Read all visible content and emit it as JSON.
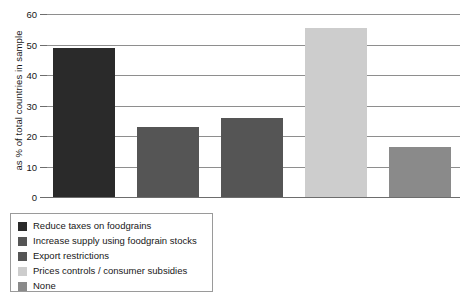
{
  "chart_data": {
    "type": "bar",
    "title": "",
    "xlabel": "",
    "ylabel": "as % of total countries in sample",
    "ylim": [
      0,
      60
    ],
    "yticks": [
      0,
      10,
      20,
      30,
      40,
      50,
      60
    ],
    "ytick_labels": [
      "0",
      "10",
      "20",
      "30",
      "40",
      "50",
      "60"
    ],
    "grid": true,
    "legend_position": "below-left",
    "categories": [
      "Reduce taxes on foodgrains",
      "Increase supply using foodgrain stocks",
      "Export restrictions",
      "Prices controls / consumer subsidies",
      "None"
    ],
    "values": [
      49,
      23,
      26,
      55.5,
      16.5
    ],
    "colors": [
      "#2a2a2a",
      "#555555",
      "#555555",
      "#cdcdcd",
      "#8a8a8a"
    ],
    "bars": [
      {
        "label": "Reduce taxes on foodgrains",
        "value": 49,
        "color": "#2a2a2a"
      },
      {
        "label": "Increase supply using foodgrain stocks",
        "value": 23,
        "color": "#555555"
      },
      {
        "label": "Export restrictions",
        "value": 26,
        "color": "#555555"
      },
      {
        "label": "Prices controls / consumer subsidies",
        "value": 55.5,
        "color": "#cdcdcd"
      },
      {
        "label": "None",
        "value": 16.5,
        "color": "#8a8a8a"
      }
    ]
  },
  "legend": {
    "items": [
      {
        "label": "Reduce taxes on foodgrains",
        "color": "#2a2a2a"
      },
      {
        "label": "Increase supply using foodgrain stocks",
        "color": "#555555"
      },
      {
        "label": "Export restrictions",
        "color": "#555555"
      },
      {
        "label": "Prices controls / consumer subsidies",
        "color": "#cdcdcd"
      },
      {
        "label": "None",
        "color": "#8a8a8a"
      }
    ]
  }
}
